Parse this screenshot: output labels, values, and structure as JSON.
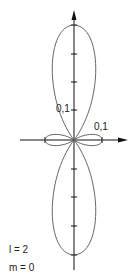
{
  "diagram": {
    "type": "polar orbital plot",
    "labels": {
      "vertical_scale": "0,1",
      "horizontal_scale": "0,1",
      "l_value": "l = 2",
      "m_value": "m = 0"
    },
    "colors": {
      "line": "#555555",
      "axis": "#111111"
    }
  }
}
